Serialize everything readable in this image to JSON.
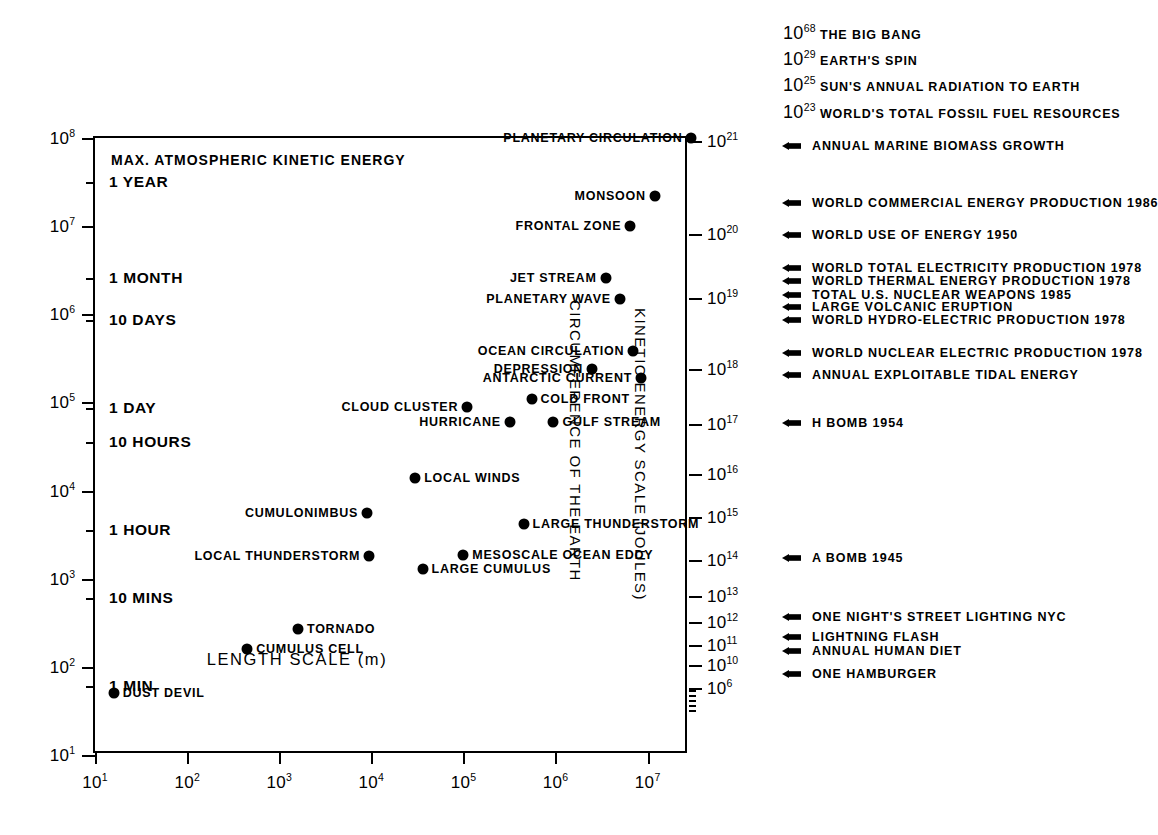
{
  "chart_data": {
    "type": "scatter",
    "title": "",
    "xlabel": "LENGTH SCALE (m)",
    "ylabel": "TIME SCALE (SECS)",
    "rlabel_energy": "KINETIC ENERGY SCALE (JOULES)",
    "rlabel_circumference": "CIRCUMFERENCE OF THE EARTH",
    "inner_note": "MAX. ATMOSPHERIC KINETIC ENERGY",
    "grid": false,
    "xlim_log10": [
      1,
      7.45
    ],
    "ylim_log10": [
      1,
      8
    ],
    "xticks": [
      "10¹",
      "10²",
      "10³",
      "10⁴",
      "10⁵",
      "10⁶",
      "10⁷"
    ],
    "xtick_exponents": [
      1,
      2,
      3,
      4,
      5,
      6,
      7
    ],
    "ytick_exponents": [
      8,
      7,
      6,
      5,
      4,
      3,
      2,
      1
    ],
    "right_axis_exponents": [
      21,
      20,
      19,
      18,
      17,
      16,
      15,
      14,
      13,
      12,
      11,
      10,
      6
    ],
    "time_annotations": [
      {
        "label": "1 YEAR",
        "seconds": 31536000
      },
      {
        "label": "1 MONTH",
        "seconds": 2592000
      },
      {
        "label": "10 DAYS",
        "seconds": 864000
      },
      {
        "label": "1 DAY",
        "seconds": 86400
      },
      {
        "label": "10 HOURS",
        "seconds": 36000
      },
      {
        "label": "1 HOUR",
        "seconds": 3600
      },
      {
        "label": "10 MINS",
        "seconds": 600
      },
      {
        "label": "1 MIN",
        "seconds": 60
      }
    ],
    "points": [
      {
        "name": "PLANETARY CIRCULATION",
        "x": 30000000.0,
        "y": 100000000.0,
        "label_side": "left"
      },
      {
        "name": "MONSOON",
        "x": 12000000.0,
        "y": 22000000.0,
        "label_side": "left"
      },
      {
        "name": "FRONTAL ZONE",
        "x": 6500000.0,
        "y": 10000000.0,
        "label_side": "left"
      },
      {
        "name": "JET STREAM",
        "x": 3500000.0,
        "y": 2600000.0,
        "label_side": "left"
      },
      {
        "name": "PLANETARY WAVE",
        "x": 5000000.0,
        "y": 1500000.0,
        "label_side": "left"
      },
      {
        "name": "OCEAN CIRCULATION",
        "x": 7000000.0,
        "y": 380000.0,
        "label_side": "left"
      },
      {
        "name": "DEPRESSION",
        "x": 2500000.0,
        "y": 240000.0,
        "label_side": "left"
      },
      {
        "name": "ANTARCTIC CURRENT",
        "x": 8500000.0,
        "y": 190000.0,
        "label_side": "left"
      },
      {
        "name": "COLD FRONT",
        "x": 550000.0,
        "y": 110000.0,
        "label_side": "right"
      },
      {
        "name": "CLOUD CLUSTER",
        "x": 110000.0,
        "y": 88000.0,
        "label_side": "left"
      },
      {
        "name": "HURRICANE",
        "x": 320000.0,
        "y": 60000.0,
        "label_side": "left"
      },
      {
        "name": "GULF STREAM",
        "x": 950000.0,
        "y": 60000.0,
        "label_side": "right"
      },
      {
        "name": "LOCAL WINDS",
        "x": 30000.0,
        "y": 14000.0,
        "label_side": "right"
      },
      {
        "name": "CUMULONIMBUS",
        "x": 9000.0,
        "y": 5500.0,
        "label_side": "left"
      },
      {
        "name": "LARGE THUNDERSTORM",
        "x": 450000.0,
        "y": 4200.0,
        "label_side": "right"
      },
      {
        "name": "LOCAL THUNDERSTORM",
        "x": 9500.0,
        "y": 1800.0,
        "label_side": "left"
      },
      {
        "name": "MESOSCALE OCEAN EDDY",
        "x": 100000.0,
        "y": 1850.0,
        "label_side": "right"
      },
      {
        "name": "LARGE CUMULUS",
        "x": 36000.0,
        "y": 1300.0,
        "label_side": "right"
      },
      {
        "name": "TORNADO",
        "x": 1600.0,
        "y": 270.0,
        "label_side": "right"
      },
      {
        "name": "CUMULUS CELL",
        "x": 450.0,
        "y": 160.0,
        "label_side": "right"
      },
      {
        "name": "DUST DEVIL",
        "x": 16.0,
        "y": 50.0,
        "label_side": "right"
      }
    ],
    "header_energy_items": [
      {
        "exponent": 68,
        "label": "THE BIG BANG"
      },
      {
        "exponent": 29,
        "label": "EARTH'S SPIN"
      },
      {
        "exponent": 25,
        "label": "SUN'S ANNUAL RADIATION TO EARTH"
      },
      {
        "exponent": 23,
        "label": "WORLD'S TOTAL FOSSIL FUEL RESOURCES"
      }
    ],
    "legend_items": [
      {
        "label": "ANNUAL MARINE BIOMASS GROWTH",
        "y_px": 146
      },
      {
        "label": "WORLD COMMERCIAL ENERGY PRODUCTION 1986",
        "y_px": 203
      },
      {
        "label": "WORLD USE OF ENERGY 1950",
        "y_px": 235
      },
      {
        "label": "WORLD TOTAL ELECTRICITY PRODUCTION 1978",
        "y_px": 268
      },
      {
        "label": "WORLD THERMAL ENERGY PRODUCTION 1978",
        "y_px": 281
      },
      {
        "label": "TOTAL U.S. NUCLEAR WEAPONS 1985",
        "y_px": 295
      },
      {
        "label": "LARGE VOLCANIC ERUPTION",
        "y_px": 307
      },
      {
        "label": "WORLD HYDRO-ELECTRIC PRODUCTION 1978",
        "y_px": 320
      },
      {
        "label": "WORLD NUCLEAR ELECTRIC PRODUCTION 1978",
        "y_px": 353
      },
      {
        "label": "ANNUAL EXPLOITABLE TIDAL ENERGY",
        "y_px": 375
      },
      {
        "label": "H BOMB 1954",
        "y_px": 423
      },
      {
        "label": "A BOMB 1945",
        "y_px": 558
      },
      {
        "label": "ONE NIGHT'S STREET LIGHTING NYC",
        "y_px": 617
      },
      {
        "label": "LIGHTNING FLASH",
        "y_px": 637
      },
      {
        "label": "ANNUAL HUMAN DIET",
        "y_px": 651
      },
      {
        "label": "ONE HAMBURGER",
        "y_px": 674
      }
    ]
  }
}
